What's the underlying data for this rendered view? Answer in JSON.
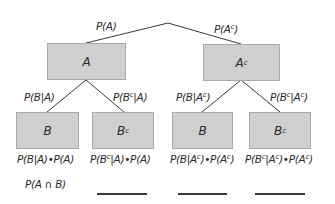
{
  "tree": {
    "level1": {
      "edges": [
        {
          "label": "P(A)"
        },
        {
          "label_base": "P(A",
          "label_sup": "c",
          "label_end": ")"
        }
      ],
      "nodes": [
        {
          "label": "A"
        },
        {
          "label_base": "A",
          "label_sup": "c"
        }
      ]
    },
    "level2": {
      "edges": [
        {
          "label": "P(B|A)"
        },
        {
          "label_base": "P(B",
          "label_sup": "c",
          "label_end": "|A)"
        },
        {
          "label_base": "P(B|A",
          "label_sup": "c",
          "label_end": ")"
        },
        {
          "label_base": "P(B",
          "label_sup": "c",
          "label_mid": "|A",
          "label_sup2": "c",
          "label_end": ")"
        }
      ],
      "nodes": [
        {
          "label": "B"
        },
        {
          "label_base": "B",
          "label_sup": "c"
        },
        {
          "label": "B"
        },
        {
          "label_base": "B",
          "label_sup": "c"
        }
      ]
    },
    "products": [
      {
        "label": "P(B|A)•P(A)"
      },
      {
        "a": "P(B",
        "s1": "c",
        "b": "|A)•P(A)"
      },
      {
        "a": "P(B|A",
        "s1": "c",
        "b": ")•P(A",
        "s2": "c",
        "c": ")"
      },
      {
        "a": "P(B",
        "s1": "c",
        "b": "|A",
        "s2": "c",
        "c": ")•P(A",
        "s3": "c",
        "d": ")"
      }
    ],
    "intersection_row": {
      "label": "P(A ∩ B)",
      "blanks": 3
    }
  },
  "colors": {
    "box_fill": "#cfcfcf",
    "box_border": "#a9a9a9",
    "line": "#3a3a3a",
    "text": "#2b2b2b"
  }
}
